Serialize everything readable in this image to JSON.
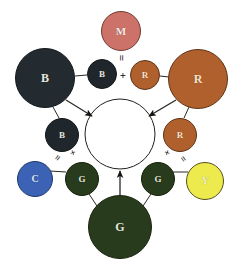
{
  "figure": {
    "background": "#ffffff",
    "width": 241,
    "height": 264
  },
  "center": {
    "name": "white-result-circle",
    "label": "",
    "fill": "#ffffff",
    "stroke": "#20201e",
    "cx": 120,
    "cy": 134,
    "r": 35
  },
  "nodes": [
    {
      "id": "m-magenta",
      "label": "M",
      "fill": "#cd7268",
      "stroke": "#6f3b33",
      "cx": 121,
      "cy": 31,
      "r": 20,
      "text_color": "#f6e9e6",
      "font_size": 11
    },
    {
      "id": "b-large",
      "label": "B",
      "fill": "#232b30",
      "stroke": "#12171a",
      "cx": 45,
      "cy": 78,
      "r": 30,
      "text_color": "#e9e6df",
      "font_size": 12
    },
    {
      "id": "b-small-top",
      "label": "B",
      "fill": "#20272c",
      "stroke": "#12171a",
      "cx": 102,
      "cy": 74,
      "r": 15,
      "text_color": "#e9e6df",
      "font_size": 9
    },
    {
      "id": "r-small-top",
      "label": "R",
      "fill": "#b0602c",
      "stroke": "#5d3317",
      "cx": 145,
      "cy": 75,
      "r": 15,
      "text_color": "#f8e2cd",
      "font_size": 9
    },
    {
      "id": "r-large",
      "label": "R",
      "fill": "#b0602c",
      "stroke": "#5d3317",
      "cx": 198,
      "cy": 79,
      "r": 30,
      "text_color": "#f8e2cd",
      "font_size": 12
    },
    {
      "id": "b-small-left",
      "label": "B",
      "fill": "#20272c",
      "stroke": "#12171a",
      "cx": 62,
      "cy": 135,
      "r": 17,
      "text_color": "#e9e6df",
      "font_size": 9
    },
    {
      "id": "r-small-right",
      "label": "R",
      "fill": "#b0602c",
      "stroke": "#5d3317",
      "cx": 180,
      "cy": 135,
      "r": 17,
      "text_color": "#f8e2cd",
      "font_size": 9
    },
    {
      "id": "c-cyan",
      "label": "C",
      "fill": "#3b62b4",
      "stroke": "#22386b",
      "cx": 35,
      "cy": 179,
      "r": 18,
      "text_color": "#dfe6f5",
      "font_size": 10
    },
    {
      "id": "g-small-left",
      "label": "G",
      "fill": "#283b1c",
      "stroke": "#16240e",
      "cx": 82,
      "cy": 179,
      "r": 17,
      "text_color": "#e3e6dd",
      "font_size": 9
    },
    {
      "id": "g-small-right",
      "label": "G",
      "fill": "#283b1c",
      "stroke": "#16240e",
      "cx": 158,
      "cy": 179,
      "r": 17,
      "text_color": "#e3e6dd",
      "font_size": 9
    },
    {
      "id": "y-yellow",
      "label": "Y",
      "fill": "#ecea4c",
      "stroke": "#57521b",
      "cx": 205,
      "cy": 181,
      "r": 19,
      "text_color": "#f4f3c8",
      "font_size": 10
    },
    {
      "id": "g-large",
      "label": "G",
      "fill": "#283b1c",
      "stroke": "#16240e",
      "cx": 120,
      "cy": 227,
      "r": 32,
      "text_color": "#e3e6dd",
      "font_size": 12
    }
  ],
  "operators": [
    {
      "id": "equals-top",
      "symbol": "=",
      "x": 121,
      "y": 58,
      "rotation": 90,
      "font_size": 11
    },
    {
      "id": "plus-top",
      "symbol": "+",
      "x": 123,
      "y": 75,
      "rotation": 0,
      "font_size": 11
    },
    {
      "id": "equals-left",
      "symbol": "=",
      "x": 58,
      "y": 158,
      "rotation": -55,
      "font_size": 10
    },
    {
      "id": "plus-left",
      "symbol": "+",
      "x": 73,
      "y": 153,
      "rotation": -20,
      "font_size": 10
    },
    {
      "id": "plus-right",
      "symbol": "+",
      "x": 167,
      "y": 153,
      "rotation": 20,
      "font_size": 10
    },
    {
      "id": "equals-right",
      "symbol": "=",
      "x": 183,
      "y": 159,
      "rotation": 55,
      "font_size": 10
    }
  ],
  "connectors": [
    {
      "id": "link-b-large-to-b-small-top",
      "kind": "line",
      "x1": 75,
      "y1": 76,
      "x2": 87,
      "y2": 75
    },
    {
      "id": "link-r-small-top-to-r-large",
      "kind": "line",
      "x1": 160,
      "y1": 76,
      "x2": 169,
      "y2": 77
    },
    {
      "id": "link-b-large-to-b-small-left",
      "kind": "line",
      "x1": 53,
      "y1": 107,
      "x2": 59,
      "y2": 118
    },
    {
      "id": "link-r-large-to-r-small-right",
      "kind": "line",
      "x1": 189,
      "y1": 107,
      "x2": 184,
      "y2": 118
    },
    {
      "id": "link-c-to-g-small-left",
      "kind": "line",
      "x1": 50,
      "y1": 171,
      "x2": 66,
      "y2": 172
    },
    {
      "id": "link-g-small-right-to-y",
      "kind": "line",
      "x1": 173,
      "y1": 172,
      "x2": 188,
      "y2": 172
    },
    {
      "id": "link-g-large-to-g-small-left",
      "kind": "line",
      "x1": 97,
      "y1": 206,
      "x2": 89,
      "y2": 194
    },
    {
      "id": "link-g-large-to-g-small-right",
      "kind": "line",
      "x1": 143,
      "y1": 206,
      "x2": 151,
      "y2": 194
    },
    {
      "id": "arrow-b-large-to-center",
      "kind": "arrow",
      "x1": 66,
      "y1": 100,
      "x2": 92,
      "y2": 116
    },
    {
      "id": "arrow-r-large-to-center",
      "kind": "arrow",
      "x1": 176,
      "y1": 100,
      "x2": 149,
      "y2": 116
    },
    {
      "id": "arrow-g-large-to-center",
      "kind": "arrow",
      "x1": 120,
      "y1": 196,
      "x2": 120,
      "y2": 171
    }
  ]
}
